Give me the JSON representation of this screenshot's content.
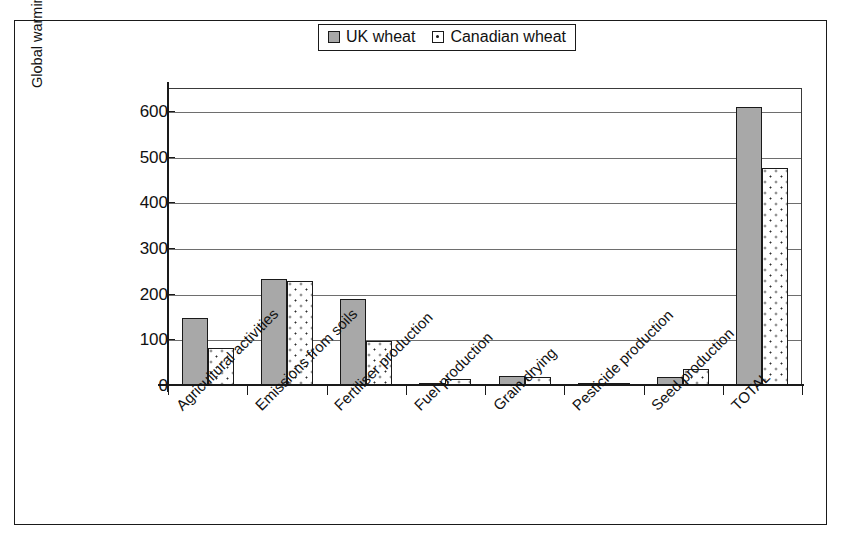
{
  "chart_data": {
    "type": "bar",
    "title": "",
    "xlabel": "",
    "ylabel": "Global warming potential (kg CO2 eq./tonne wheat)",
    "ylim": [
      0,
      650
    ],
    "yticks": [
      0,
      100,
      200,
      300,
      400,
      500,
      600
    ],
    "ytick_labels": [
      "0",
      "100",
      "200",
      "300",
      "400",
      "500",
      "600"
    ],
    "grid": true,
    "legend_position": "top-center",
    "categories": [
      "Agricultural activities",
      "Emissions from soils",
      "Fertiliser production",
      "Fuel production",
      "Grain drying",
      "Pesticide production",
      "Seed production",
      "TOTAL"
    ],
    "series": [
      {
        "name": "UK wheat",
        "color": "#a8a8a8",
        "pattern": "solid-gray",
        "values": [
          146,
          233,
          189,
          2,
          19,
          4,
          18,
          609
        ]
      },
      {
        "name": "Canadian wheat",
        "color": "#ffffff",
        "pattern": "white-dotted",
        "values": [
          82,
          228,
          96,
          14,
          18,
          4,
          35,
          474
        ]
      }
    ]
  },
  "legend": {
    "entries": [
      {
        "label": "UK wheat",
        "swatch": "legend-swatch-uk"
      },
      {
        "label": "Canadian wheat",
        "swatch": "legend-swatch-canadian"
      }
    ]
  },
  "axes": {
    "y_title": "Global warming potential (kg CO2 eq./tonne wheat)"
  }
}
